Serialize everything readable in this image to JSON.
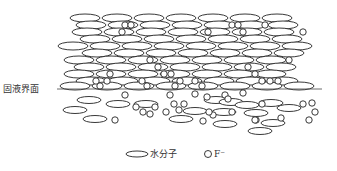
{
  "diagram": {
    "interface_label": "固液界面",
    "legend": [
      {
        "symbol": "ellipse",
        "label": "水分子"
      },
      {
        "symbol": "circle",
        "label": "F⁻"
      }
    ],
    "colors": {
      "stroke": "#222222",
      "background": "#ffffff"
    }
  }
}
